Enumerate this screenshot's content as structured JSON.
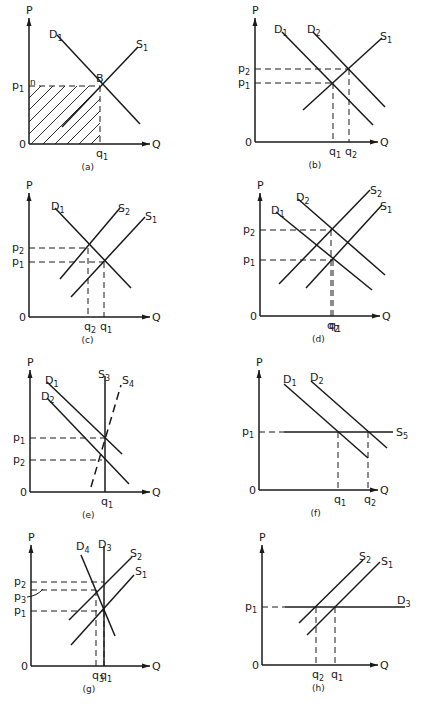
{
  "figure": {
    "corner_mark": "",
    "panels": [
      {
        "id": "a",
        "caption": "(a)",
        "origin": [
          29,
          144
        ],
        "p_top": 18,
        "q_end": 150,
        "axis_labels": {
          "y": "P",
          "x": "Q",
          "origin": "0"
        },
        "curves": [
          {
            "label": "D",
            "sub": "1",
            "from": [
              57,
              35
            ],
            "to": [
              140,
              124
            ],
            "style": "solid",
            "label_pos": [
              49,
              38
            ]
          },
          {
            "label": "S",
            "sub": "1",
            "from": [
              62,
              127
            ],
            "to": [
              138,
              47
            ],
            "style": "solid",
            "label_pos": [
              136,
              48
            ]
          }
        ],
        "points": [
          {
            "label": "B",
            "at": [
              100,
              86
            ],
            "label_pos": [
              96,
              82
            ]
          }
        ],
        "price_lines": [
          {
            "label": "p",
            "sub": "1",
            "y": 86,
            "x_to": 100,
            "extra": "n"
          }
        ],
        "quantity_lines": [
          {
            "label": "q",
            "sub": "1",
            "x": 100,
            "y_from": 86
          }
        ],
        "hatched_area": {
          "x": 29,
          "y": 86,
          "w": 71,
          "h": 58
        }
      },
      {
        "id": "b",
        "caption": "(b)",
        "origin": [
          255,
          142
        ],
        "p_top": 18,
        "q_end": 378,
        "axis_labels": {
          "y": "P",
          "x": "Q",
          "origin": "0"
        },
        "curves": [
          {
            "label": "D",
            "sub": "1",
            "from": [
              282,
              32
            ],
            "to": [
              373,
              125
            ],
            "style": "solid",
            "label_pos": [
              274,
              33
            ]
          },
          {
            "label": "D",
            "sub": "2",
            "from": [
              313,
              32
            ],
            "to": [
              385,
              107
            ],
            "style": "solid",
            "label_pos": [
              307,
              33
            ]
          },
          {
            "label": "S",
            "sub": "1",
            "from": [
              303,
              110
            ],
            "to": [
              382,
              38
            ],
            "style": "solid",
            "label_pos": [
              380,
              40
            ]
          }
        ],
        "points": [],
        "price_lines": [
          {
            "label": "p",
            "sub": "2",
            "y": 69,
            "x_to": 349
          },
          {
            "label": "p",
            "sub": "1",
            "y": 83,
            "x_to": 333
          }
        ],
        "quantity_lines": [
          {
            "label": "q",
            "sub": "1",
            "x": 333,
            "y_from": 83
          },
          {
            "label": "q",
            "sub": "2",
            "x": 349,
            "y_from": 69
          }
        ]
      },
      {
        "id": "c",
        "caption": "(c)",
        "origin": [
          29,
          317
        ],
        "p_top": 193,
        "q_end": 150,
        "axis_labels": {
          "y": "P",
          "x": "Q",
          "origin": "0"
        },
        "curves": [
          {
            "label": "D",
            "sub": "1",
            "from": [
              55,
              208
            ],
            "to": [
              131,
              288
            ],
            "style": "solid",
            "label_pos": [
              51,
              210
            ]
          },
          {
            "label": "S",
            "sub": "2",
            "from": [
              60,
              279
            ],
            "to": [
              120,
              208
            ],
            "style": "solid",
            "label_pos": [
              118,
              212
            ]
          },
          {
            "label": "S",
            "sub": "1",
            "from": [
              71,
              297
            ],
            "to": [
              145,
              217
            ],
            "style": "solid",
            "label_pos": [
              145,
              220
            ]
          }
        ],
        "points": [],
        "price_lines": [
          {
            "label": "p",
            "sub": "2",
            "y": 248,
            "x_to": 88
          },
          {
            "label": "p",
            "sub": "1",
            "y": 262,
            "x_to": 104
          }
        ],
        "quantity_lines": [
          {
            "label": "q",
            "sub": "2",
            "x": 88,
            "y_from": 248
          },
          {
            "label": "q",
            "sub": "1",
            "x": 104,
            "y_from": 262
          }
        ]
      },
      {
        "id": "d",
        "caption": "(d)",
        "origin": [
          260,
          316
        ],
        "p_top": 193,
        "q_end": 380,
        "axis_labels": {
          "y": "P",
          "x": "Q",
          "origin": "0"
        },
        "curves": [
          {
            "label": "D",
            "sub": "1",
            "from": [
              276,
              212
            ],
            "to": [
              372,
              290
            ],
            "style": "solid",
            "label_pos": [
              271,
              214
            ]
          },
          {
            "label": "D",
            "sub": "2",
            "from": [
              298,
              199
            ],
            "to": [
              385,
              275
            ],
            "style": "solid",
            "label_pos": [
              296,
              201
            ]
          },
          {
            "label": "S",
            "sub": "2",
            "from": [
              279,
              284
            ],
            "to": [
              370,
              190
            ],
            "style": "solid",
            "label_pos": [
              370,
              194
            ]
          },
          {
            "label": "S",
            "sub": "1",
            "from": [
              306,
              288
            ],
            "to": [
              382,
              205
            ],
            "style": "solid",
            "label_pos": [
              380,
              210
            ]
          }
        ],
        "points": [],
        "price_lines": [
          {
            "label": "p",
            "sub": "2",
            "y": 230,
            "x_to": 331
          },
          {
            "label": "p",
            "sub": "1",
            "y": 260,
            "x_to": 333
          }
        ],
        "quantity_lines": [
          {
            "label": "q",
            "sub": "2",
            "x": 331,
            "y_from": 230
          },
          {
            "label": "q",
            "sub": "1",
            "x": 333,
            "y_from": 260
          }
        ]
      },
      {
        "id": "e",
        "caption": "(e)",
        "origin": [
          30,
          492
        ],
        "p_top": 370,
        "q_end": 150,
        "axis_labels": {
          "y": "P",
          "x": "Q",
          "origin": "0"
        },
        "curves": [
          {
            "label": "D",
            "sub": "1",
            "from": [
              47,
              382
            ],
            "to": [
              122,
              454
            ],
            "style": "solid",
            "label_pos": [
              45,
              384
            ]
          },
          {
            "label": "D",
            "sub": "2",
            "from": [
              47,
              398
            ],
            "to": [
              129,
              484
            ],
            "style": "solid",
            "label_pos": [
              41,
              400
            ]
          },
          {
            "label": "S",
            "sub": "3",
            "from": [
              105,
              376
            ],
            "to": [
              105,
              492
            ],
            "style": "solid",
            "label_pos": [
              98,
              378
            ]
          },
          {
            "label": "S",
            "sub": "4",
            "from": [
              91,
              487
            ],
            "to": [
              121,
              385
            ],
            "style": "dashed",
            "label_pos": [
              122,
              384
            ]
          }
        ],
        "points": [],
        "price_lines": [
          {
            "label": "p",
            "sub": "1",
            "y": 438,
            "x_to": 105
          },
          {
            "label": "p",
            "sub": "2",
            "y": 460,
            "x_to": 102
          }
        ],
        "quantity_lines": [
          {
            "label": "q",
            "sub": "1",
            "x": 105,
            "y_from": 492
          }
        ]
      },
      {
        "id": "f",
        "caption": "(f)",
        "origin": [
          259,
          490
        ],
        "p_top": 370,
        "q_end": 378,
        "axis_labels": {
          "y": "P",
          "x": "Q",
          "origin": "0"
        },
        "curves": [
          {
            "label": "D",
            "sub": "1",
            "from": [
              284,
              384
            ],
            "to": [
              368,
              458
            ],
            "style": "solid",
            "label_pos": [
              283,
              383
            ]
          },
          {
            "label": "D",
            "sub": "2",
            "from": [
              311,
              381
            ],
            "to": [
              387,
              448
            ],
            "style": "solid",
            "label_pos": [
              310,
              381
            ]
          },
          {
            "label": "S",
            "sub": "5",
            "from": [
              284,
              432
            ],
            "to": [
              393,
              432
            ],
            "style": "solid",
            "label_pos": [
              396,
              436
            ]
          }
        ],
        "points": [],
        "price_lines": [
          {
            "label": "p",
            "sub": "1",
            "y": 432,
            "x_to": 284
          }
        ],
        "quantity_lines": [
          {
            "label": "q",
            "sub": "1",
            "x": 338,
            "y_from": 432
          },
          {
            "label": "q",
            "sub": "2",
            "x": 368,
            "y_from": 432
          }
        ]
      },
      {
        "id": "g",
        "caption": "(g)",
        "origin": [
          31,
          666
        ],
        "p_top": 545,
        "q_end": 150,
        "axis_labels": {
          "y": "P",
          "x": "Q",
          "origin": "0"
        },
        "curves": [
          {
            "label": "D",
            "sub": "4",
            "from": [
              81,
              555
            ],
            "to": [
              115,
              636
            ],
            "style": "solid",
            "label_pos": [
              76,
              550
            ]
          },
          {
            "label": "D",
            "sub": "3",
            "from": [
              104,
              546
            ],
            "to": [
              104,
              666
            ],
            "style": "solid",
            "label_pos": [
              98,
              548
            ]
          },
          {
            "label": "S",
            "sub": "2",
            "from": [
              69,
              620
            ],
            "to": [
              132,
              557
            ],
            "style": "solid",
            "label_pos": [
              130,
              557
            ]
          },
          {
            "label": "S",
            "sub": "1",
            "from": [
              71,
              645
            ],
            "to": [
              134,
              575
            ],
            "style": "solid",
            "label_pos": [
              135,
              575
            ]
          }
        ],
        "points": [],
        "price_lines": [
          {
            "label": "p",
            "sub": "2",
            "y": 582,
            "x_to": 104
          },
          {
            "label": "p",
            "sub": "3",
            "y": 590,
            "x_to": 96,
            "arrow": true
          },
          {
            "label": "p",
            "sub": "1",
            "y": 611,
            "x_to": 104
          }
        ],
        "quantity_lines": [
          {
            "label": "q",
            "sub": "3",
            "x": 96,
            "y_from": 590
          },
          {
            "label": "q",
            "sub": "1",
            "x": 104,
            "y_from": 611
          }
        ]
      },
      {
        "id": "h",
        "caption": "(h)",
        "origin": [
          262,
          665
        ],
        "p_top": 545,
        "q_end": 378,
        "axis_labels": {
          "y": "P",
          "x": "Q",
          "origin": "0"
        },
        "curves": [
          {
            "label": "S",
            "sub": "2",
            "from": [
              299,
              623
            ],
            "to": [
              363,
              560
            ],
            "style": "solid",
            "label_pos": [
              359,
              560
            ]
          },
          {
            "label": "S",
            "sub": "1",
            "from": [
              307,
              635
            ],
            "to": [
              380,
              562
            ],
            "style": "solid",
            "label_pos": [
              381,
              565
            ]
          },
          {
            "label": "D",
            "sub": "3",
            "from": [
              285,
              607
            ],
            "to": [
              405,
              607
            ],
            "style": "solid",
            "label_pos": [
              397,
              604
            ]
          }
        ],
        "points": [],
        "price_lines": [
          {
            "label": "p",
            "sub": "1",
            "y": 607,
            "x_to": 285
          }
        ],
        "quantity_lines": [
          {
            "label": "q",
            "sub": "2",
            "x": 316,
            "y_from": 607
          },
          {
            "label": "q",
            "sub": "1",
            "x": 335,
            "y_from": 607
          }
        ]
      }
    ]
  }
}
